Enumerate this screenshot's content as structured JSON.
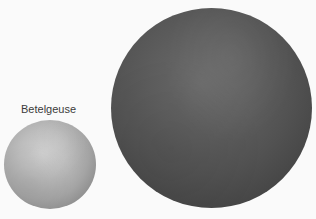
{
  "labels": {
    "small_star": "Betelgeuse"
  },
  "objects": [
    {
      "name": "Betelgeuse",
      "description": "smaller light-gray sphere",
      "color": "#b8b8b8"
    },
    {
      "name": "large-star",
      "description": "larger dark-gray sphere, unlabeled",
      "color": "#555555"
    }
  ]
}
